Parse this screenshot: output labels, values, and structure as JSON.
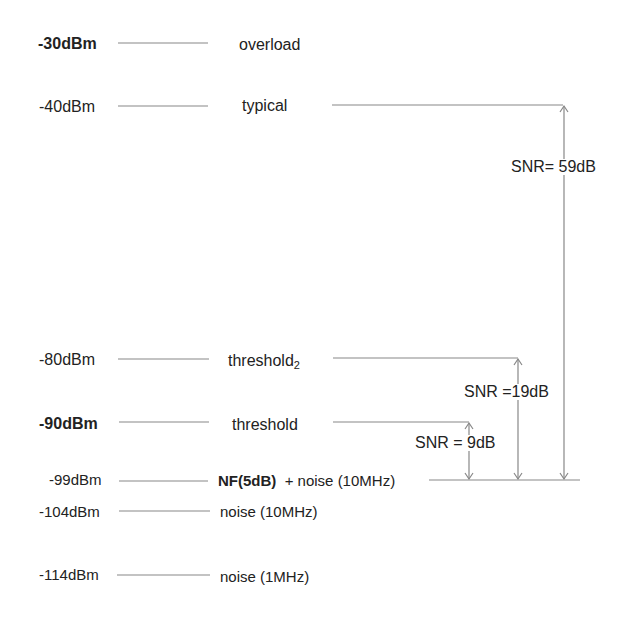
{
  "diagram": {
    "levels": [
      {
        "level": "-30dBm",
        "bold": true,
        "description": "overload"
      },
      {
        "level": "-40dBm",
        "bold": false,
        "description": "typical"
      },
      {
        "level": "-80dBm",
        "bold": false,
        "description": "threshold",
        "subscript": "2"
      },
      {
        "level": "-90dBm",
        "bold": true,
        "description": "threshold"
      },
      {
        "level": "-99dBm",
        "bold": false,
        "description_bold": "NF(5dB)",
        "description": "+ noise (10MHz)"
      },
      {
        "level": "-104dBm",
        "bold": false,
        "description": "noise (10MHz)"
      },
      {
        "level": "-114dBm",
        "bold": false,
        "description": "noise (1MHz)"
      }
    ],
    "snr_annotations": [
      {
        "label": "SNR= 59dB",
        "from": "-40dBm",
        "to": "-99dBm"
      },
      {
        "label": "SNR =19dB",
        "from": "-80dBm",
        "to": "-99dBm"
      },
      {
        "label": "SNR = 9dB",
        "from": "-90dBm",
        "to": "-99dBm"
      }
    ],
    "line_color": "#888888"
  }
}
